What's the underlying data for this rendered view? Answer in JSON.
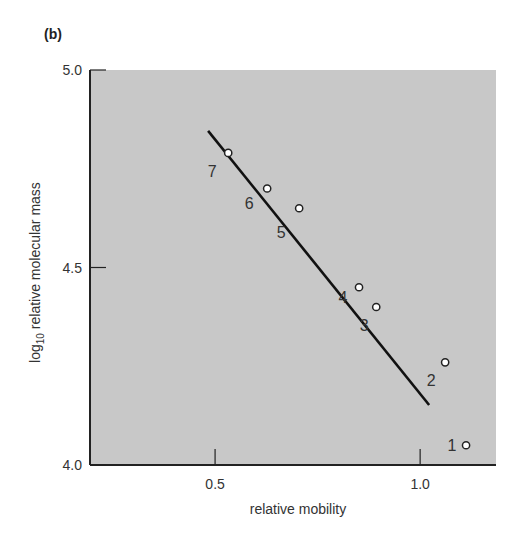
{
  "panel_label": "(b)",
  "chart_data": {
    "type": "scatter",
    "title": "",
    "xlabel": "relative mobility",
    "ylabel_main": "log",
    "ylabel_sub": "10",
    "ylabel_rest": " relative molecular mass",
    "xlim": [
      0.195,
      1.185
    ],
    "ylim": [
      4.0,
      5.0
    ],
    "xticks": [
      {
        "value": 0.5,
        "label": "0.5"
      },
      {
        "value": 1.0,
        "label": "1.0"
      }
    ],
    "yticks": [
      {
        "value": 4.0,
        "label": "4.0"
      },
      {
        "value": 4.5,
        "label": "4.5"
      },
      {
        "value": 5.0,
        "label": "5.0"
      }
    ],
    "grid": false,
    "points": [
      {
        "label": "1",
        "x": 1.112,
        "y": 4.05
      },
      {
        "label": "2",
        "x": 1.061,
        "y": 4.26
      },
      {
        "label": "3",
        "x": 0.893,
        "y": 4.4
      },
      {
        "label": "4",
        "x": 0.851,
        "y": 4.45
      },
      {
        "label": "5",
        "x": 0.705,
        "y": 4.65
      },
      {
        "label": "6",
        "x": 0.627,
        "y": 4.7
      },
      {
        "label": "7",
        "x": 0.532,
        "y": 4.79
      }
    ],
    "fit_line": {
      "x": [
        0.483,
        1.022
      ],
      "y": [
        4.846,
        4.152
      ]
    },
    "colors": {
      "plot_bg": "#c8c8c8",
      "line": "#111111",
      "marker_fill": "#ffffff"
    }
  }
}
